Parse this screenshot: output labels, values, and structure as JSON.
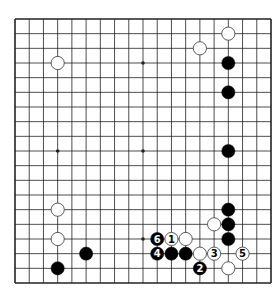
{
  "diagram": {
    "type": "go-board",
    "size": 19,
    "colors": {
      "background": "#ffffff",
      "line": "#222222",
      "black_stone": "#000000",
      "white_stone": "#ffffff",
      "white_outline": "#333333"
    },
    "star_points": [
      [
        3,
        3
      ],
      [
        9,
        3
      ],
      [
        15,
        3
      ],
      [
        3,
        9
      ],
      [
        9,
        9
      ],
      [
        15,
        9
      ],
      [
        3,
        15
      ],
      [
        9,
        15
      ],
      [
        15,
        15
      ]
    ],
    "stones": [
      {
        "color": "white",
        "col": 15,
        "row": 1,
        "label": ""
      },
      {
        "color": "white",
        "col": 13,
        "row": 2,
        "label": ""
      },
      {
        "color": "white",
        "col": 3,
        "row": 3,
        "label": ""
      },
      {
        "color": "black",
        "col": 15,
        "row": 3,
        "label": ""
      },
      {
        "color": "black",
        "col": 15,
        "row": 5,
        "label": ""
      },
      {
        "color": "black",
        "col": 15,
        "row": 9,
        "label": ""
      },
      {
        "color": "white",
        "col": 3,
        "row": 13,
        "label": ""
      },
      {
        "color": "black",
        "col": 15,
        "row": 13,
        "label": ""
      },
      {
        "color": "white",
        "col": 14,
        "row": 14,
        "label": ""
      },
      {
        "color": "black",
        "col": 15,
        "row": 14,
        "label": ""
      },
      {
        "color": "white",
        "col": 3,
        "row": 15,
        "label": ""
      },
      {
        "color": "black",
        "col": 10,
        "row": 15,
        "label": "6"
      },
      {
        "color": "white",
        "col": 11,
        "row": 15,
        "label": "1"
      },
      {
        "color": "white",
        "col": 12,
        "row": 15,
        "label": ""
      },
      {
        "color": "black",
        "col": 15,
        "row": 15,
        "label": ""
      },
      {
        "color": "black",
        "col": 5,
        "row": 16,
        "label": ""
      },
      {
        "color": "black",
        "col": 10,
        "row": 16,
        "label": "4"
      },
      {
        "color": "black",
        "col": 11,
        "row": 16,
        "label": ""
      },
      {
        "color": "black",
        "col": 12,
        "row": 16,
        "label": ""
      },
      {
        "color": "white",
        "col": 13,
        "row": 16,
        "label": ""
      },
      {
        "color": "white",
        "col": 14,
        "row": 16,
        "label": "3"
      },
      {
        "color": "white",
        "col": 16,
        "row": 16,
        "label": "5"
      },
      {
        "color": "black",
        "col": 3,
        "row": 17,
        "label": ""
      },
      {
        "color": "black",
        "col": 13,
        "row": 17,
        "label": "2"
      },
      {
        "color": "white",
        "col": 15,
        "row": 17,
        "label": ""
      }
    ]
  }
}
